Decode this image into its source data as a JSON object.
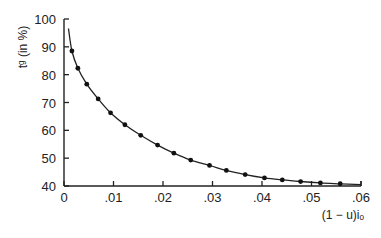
{
  "chart_data": {
    "type": "line",
    "title": "",
    "xlabel": "(1 − u)iₒ",
    "ylabel": "tᵍ (in %)",
    "xlim": [
      0,
      0.06
    ],
    "ylim": [
      40,
      100
    ],
    "xticks": [
      0,
      0.01,
      0.02,
      0.03,
      0.04,
      0.05,
      0.06
    ],
    "xtick_labels": [
      "0",
      ".01",
      ".02",
      ".03",
      ".04",
      ".05",
      ".06"
    ],
    "yticks": [
      40,
      50,
      60,
      70,
      80,
      90,
      100
    ],
    "ytick_labels": [
      "40",
      "50",
      "60",
      "70",
      "80",
      "90",
      "100"
    ],
    "grid": false,
    "legend": null,
    "series": [
      {
        "name": "fitted curve",
        "style": "line",
        "x": [
          0.0009,
          0.0016,
          0.0028,
          0.0046,
          0.0069,
          0.0094,
          0.0123,
          0.0155,
          0.0189,
          0.0222,
          0.0256,
          0.0294,
          0.0328,
          0.0366,
          0.0405,
          0.0441,
          0.0478,
          0.0518,
          0.0558,
          0.06
        ],
        "y": [
          96.6,
          88.5,
          82.3,
          76.6,
          71.3,
          66.3,
          62.0,
          58.2,
          54.7,
          51.8,
          49.3,
          47.4,
          45.6,
          44.1,
          42.9,
          42.2,
          41.6,
          41.1,
          40.8,
          40.5
        ]
      },
      {
        "name": "data points",
        "style": "markers",
        "x": [
          0.0016,
          0.0028,
          0.0046,
          0.0069,
          0.0094,
          0.0123,
          0.0155,
          0.0189,
          0.0222,
          0.0256,
          0.0294,
          0.0328,
          0.0366,
          0.0405,
          0.0441,
          0.0478,
          0.0518,
          0.0558
        ],
        "y": [
          88.5,
          82.3,
          76.6,
          71.3,
          66.3,
          62.0,
          58.2,
          54.7,
          51.8,
          49.3,
          47.4,
          45.6,
          44.1,
          42.9,
          42.2,
          41.6,
          41.1,
          40.8
        ]
      }
    ]
  }
}
